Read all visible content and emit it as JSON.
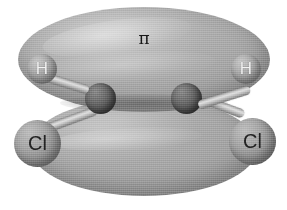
{
  "figure": {
    "background_color": "#ffffff",
    "style": "grayscale 3D space-filling orbital render"
  },
  "orbital": {
    "label": "π",
    "label_name": "pi-orbital-label",
    "lobe_top_name": "pi-lobe-upper",
    "lobe_bottom_name": "pi-lobe-lower",
    "lobe_color": "#a8a8a8"
  },
  "atoms": [
    {
      "id": "h-left",
      "element": "H",
      "label": "H",
      "label_color": "#f2f2f2",
      "sphere_color": "#a8a8a8",
      "x": 42,
      "y": 69
    },
    {
      "id": "h-right",
      "element": "H",
      "label": "H",
      "label_color": "#f2f2f2",
      "sphere_color": "#a8a8a8",
      "x": 246,
      "y": 69
    },
    {
      "id": "cl-left",
      "element": "Cl",
      "label": "Cl",
      "label_color": "#232323",
      "sphere_color": "#a0a0a0",
      "x": 37,
      "y": 143
    },
    {
      "id": "cl-right",
      "element": "Cl",
      "label": "Cl",
      "label_color": "#232323",
      "sphere_color": "#a0a0a0",
      "x": 252,
      "y": 141
    },
    {
      "id": "c-left",
      "element": "C",
      "label": "",
      "label_color": "#000000",
      "sphere_color": "#565656",
      "x": 100,
      "y": 98
    },
    {
      "id": "c-right",
      "element": "C",
      "label": "",
      "label_color": "#000000",
      "sphere_color": "#565656",
      "x": 186,
      "y": 98
    }
  ],
  "bonds": [
    {
      "id": "c-left-h-left",
      "from": "c-left",
      "to": "h-left"
    },
    {
      "id": "c-right-h-right",
      "from": "c-right",
      "to": "h-right"
    },
    {
      "id": "c-left-cl-left",
      "from": "c-left",
      "to": "cl-left"
    },
    {
      "id": "c-right-cl-right",
      "from": "c-right",
      "to": "cl-right"
    }
  ]
}
